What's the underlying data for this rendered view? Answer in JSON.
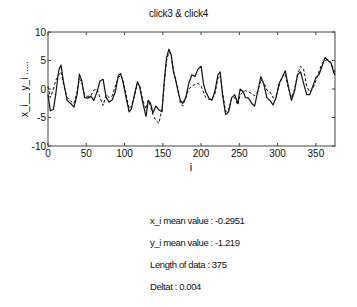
{
  "chart_data": {
    "type": "line",
    "title": "click3  & click4",
    "xlabel": "i",
    "ylabel": "x_i__  y_i .....",
    "xlim": [
      0,
      375
    ],
    "ylim": [
      -10,
      10
    ],
    "xticks": [
      0,
      50,
      100,
      150,
      200,
      250,
      300,
      350
    ],
    "yticks": [
      -10,
      -5,
      0,
      5,
      10
    ],
    "grid": false,
    "legend": "none",
    "series": [
      {
        "name": "x_i",
        "style": "solid",
        "x": [
          0,
          3,
          7,
          10,
          14,
          17,
          20,
          25,
          30,
          34,
          38,
          41,
          44,
          48,
          52,
          56,
          60,
          64,
          68,
          72,
          76,
          80,
          84,
          88,
          92,
          95,
          98,
          102,
          106,
          109,
          113,
          117,
          120,
          124,
          128,
          131,
          134,
          137,
          141,
          145,
          149,
          152,
          155,
          158,
          161,
          164,
          167,
          170,
          173,
          176,
          180,
          184,
          188,
          192,
          196,
          200,
          203,
          206,
          210,
          214,
          218,
          222,
          225,
          228,
          232,
          236,
          240,
          244,
          248,
          251,
          255,
          258,
          262,
          266,
          270,
          274,
          278,
          282,
          286,
          290,
          294,
          298,
          302,
          306,
          310,
          314,
          318,
          322,
          326,
          330,
          334,
          338,
          342,
          346,
          350,
          354,
          358,
          362,
          366,
          370,
          373,
          375
        ],
        "y": [
          -1,
          -3.8,
          -3.6,
          -1,
          3.3,
          4.2,
          1.5,
          -2,
          -2.6,
          -3.2,
          -1,
          2.6,
          1.5,
          -1.5,
          -1.6,
          -1.3,
          -2,
          -0.5,
          1.4,
          1.7,
          -1.5,
          -2.3,
          -1.9,
          -0.5,
          2.4,
          2.7,
          1.2,
          -1.5,
          -4,
          -3.5,
          -1,
          1.3,
          0.3,
          -2.5,
          -4.8,
          -2,
          -2.5,
          -4.2,
          -3,
          -3.7,
          -4,
          1.5,
          5.5,
          7,
          6,
          3,
          1.5,
          -0.5,
          -2,
          -2.5,
          -1.5,
          1,
          2.5,
          2.2,
          3.5,
          4,
          1,
          -0.5,
          -1.5,
          -2,
          -0.5,
          2.5,
          3,
          -1,
          -4.5,
          -4,
          -1.5,
          -1,
          -2.5,
          0,
          -0.5,
          -1.5,
          -1.6,
          -2.5,
          -3,
          -0.5,
          2.2,
          0.8,
          -1.5,
          -2,
          -2.8,
          -1.5,
          1,
          2,
          3.2,
          0.5,
          -2,
          -0.5,
          2.5,
          3,
          1,
          -1,
          -1,
          0.5,
          2,
          2.5,
          4,
          5.5,
          5,
          4.5,
          3,
          2.5
        ]
      },
      {
        "name": "y_i",
        "style": "dashed",
        "x": [
          0,
          3,
          7,
          10,
          14,
          17,
          20,
          25,
          30,
          34,
          38,
          41,
          44,
          48,
          52,
          56,
          60,
          64,
          68,
          72,
          76,
          80,
          84,
          88,
          92,
          95,
          98,
          102,
          106,
          109,
          113,
          117,
          120,
          124,
          128,
          131,
          134,
          137,
          141,
          145,
          149,
          152,
          155,
          158,
          161,
          164,
          167,
          170,
          173,
          176,
          180,
          184,
          188,
          192,
          196,
          200,
          203,
          206,
          210,
          214,
          218,
          222,
          225,
          228,
          232,
          236,
          240,
          244,
          248,
          251,
          255,
          258,
          262,
          266,
          270,
          274,
          278,
          282,
          286,
          290,
          294,
          298,
          302,
          306,
          310,
          314,
          318,
          322,
          326,
          330,
          334,
          338,
          342,
          346,
          350,
          354,
          358,
          362,
          366,
          370,
          373,
          375
        ],
        "y": [
          0.5,
          -1.5,
          0,
          1.5,
          2.5,
          3,
          1,
          -1.5,
          -2.2,
          -2.5,
          -0.5,
          1.8,
          1.2,
          -1.2,
          -1.3,
          -1.2,
          -0.2,
          0,
          -1.5,
          -2.9,
          -1,
          -1.5,
          -1.2,
          0.5,
          2,
          2.5,
          1.5,
          -1,
          -3.5,
          -3,
          -1.2,
          1,
          0.5,
          -2,
          -3.5,
          -2,
          -3,
          -4.5,
          -5.5,
          -6,
          -3.5,
          1,
          5,
          6.5,
          6,
          3.2,
          1.5,
          0,
          -2.5,
          -3,
          -1.5,
          0,
          0.5,
          0.8,
          1,
          0.5,
          -0.5,
          -1.5,
          -1.8,
          -1.8,
          -1,
          1.8,
          2.4,
          -0.5,
          -4,
          -3.7,
          -1.5,
          -1.5,
          -2.8,
          -1,
          -0.5,
          -0.3,
          -0.5,
          -0.8,
          -1.2,
          -0.5,
          1.6,
          1.2,
          -0.2,
          -0.5,
          -1.5,
          -1.2,
          0.5,
          2.2,
          2.6,
          0.2,
          -1.5,
          -0.2,
          2.5,
          4,
          3.5,
          0.5,
          -0.5,
          0,
          1.5,
          3,
          4.5,
          5,
          5.2,
          4.5,
          3.5,
          3
        ]
      }
    ]
  },
  "stats": {
    "x_mean": "x_i mean value : -0.2951",
    "y_mean": "y_i mean value : -1.219",
    "length": "Length of data : 375",
    "deltat": "Deltat : 0.004"
  },
  "colors": {
    "axes": "#444444",
    "line": "#111111",
    "background": "#ffffff"
  }
}
